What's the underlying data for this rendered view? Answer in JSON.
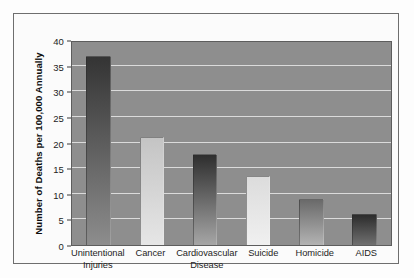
{
  "chart_data": {
    "type": "bar",
    "title": "",
    "xlabel": "",
    "ylabel": "Number of Deaths per 100,000 Annually",
    "ylim": [
      0,
      40
    ],
    "yticks": [
      0,
      5,
      10,
      15,
      20,
      25,
      30,
      35,
      40
    ],
    "ytick_labels": [
      "0",
      "5",
      "10",
      "15",
      "20",
      "25",
      "30",
      "35",
      "40"
    ],
    "grid": true,
    "legend": false,
    "categories": [
      "Unintentional Injuries",
      "Cancer",
      "Cardiovascular Disease",
      "Suicide",
      "Homicide",
      "AIDS"
    ],
    "category_lines": [
      [
        "Unintentional",
        "Injuries"
      ],
      [
        "Cancer",
        ""
      ],
      [
        "Cardiovascular",
        "Disease"
      ],
      [
        "Suicide",
        ""
      ],
      [
        "Homicide",
        ""
      ],
      [
        "AIDS",
        ""
      ]
    ],
    "values": [
      36.8,
      21.0,
      17.7,
      13.5,
      8.9,
      6.0
    ],
    "bar_colors_top": [
      "#343434",
      "#c4c4c4",
      "#2e2e2e",
      "#dcdcdc",
      "#6a6a6a",
      "#2c2c2c"
    ],
    "bar_colors_bottom": [
      "#8d8d8d",
      "#e6e6e6",
      "#a6a6a6",
      "#f0f0f0",
      "#b3b3b3",
      "#707070"
    ],
    "plot_background": "#8e8e8e",
    "gridline_color": "#e9e9e9",
    "frame_color": "#6e6e6e",
    "figure_background": "#fdfdfd"
  }
}
